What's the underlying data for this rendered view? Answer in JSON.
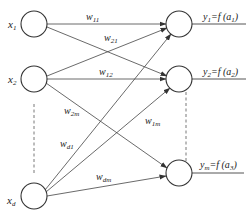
{
  "diagram": {
    "type": "single-layer neural network",
    "inputs": [
      {
        "id": "x1",
        "label": "x",
        "sub": "1"
      },
      {
        "id": "x2",
        "label": "x",
        "sub": "2"
      },
      {
        "id": "xd",
        "label": "x",
        "sub": "d"
      }
    ],
    "outputs": [
      {
        "id": "y1",
        "label": "y",
        "sub": "1",
        "eq": "=f (a",
        "eq_sub": "1",
        "close": ")"
      },
      {
        "id": "y2",
        "label": "y",
        "sub": "2",
        "eq": "=f (a",
        "eq_sub": "2",
        "close": ")"
      },
      {
        "id": "ym",
        "label": "y",
        "sub": "m",
        "eq": "=f (a",
        "eq_sub": "3",
        "close": ")"
      }
    ],
    "weights": [
      {
        "id": "w11",
        "label": "w",
        "sub": "11",
        "from": "x1",
        "to": "y1"
      },
      {
        "id": "w21",
        "label": "w",
        "sub": "21",
        "from": "x2",
        "to": "y1"
      },
      {
        "id": "w12",
        "label": "w",
        "sub": "12",
        "from": "x2",
        "to": "y2"
      },
      {
        "id": "w2m",
        "label": "w",
        "sub": "2m",
        "from": "x2",
        "to": "ym"
      },
      {
        "id": "w1m",
        "label": "w",
        "sub": "1m",
        "from": "x1",
        "to": "ym"
      },
      {
        "id": "wd1",
        "label": "w",
        "sub": "d1",
        "from": "xd",
        "to": "y1"
      },
      {
        "id": "wdm",
        "label": "w",
        "sub": "dm",
        "from": "xd",
        "to": "ym"
      }
    ]
  }
}
